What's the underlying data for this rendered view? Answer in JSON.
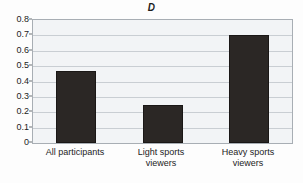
{
  "chart_data": {
    "type": "bar",
    "title": "D",
    "subtitle": "",
    "xlabel": "",
    "ylabel": "",
    "categories": [
      "All participants",
      "Light sports viewers",
      "Heavy sports viewers"
    ],
    "category_lines": [
      [
        "All participants"
      ],
      [
        "Light sports",
        "viewers"
      ],
      [
        "Heavy sports",
        "viewers"
      ]
    ],
    "values": [
      0.47,
      0.25,
      0.7
    ],
    "ylim": [
      0,
      0.8
    ],
    "ytick_labels": [
      "0.8",
      "0.7",
      "0.6",
      "0.5",
      "0.4",
      "0.3",
      "0.2",
      "0.1",
      "0"
    ],
    "ytick_values": [
      0.8,
      0.7,
      0.6,
      0.5,
      0.4,
      0.3,
      0.2,
      0.1,
      0
    ],
    "grid": true,
    "grid_axis": "y",
    "legend": false,
    "legend_position": "none",
    "bar_color": "#2b2725",
    "plot_background": "#f2f4f6",
    "gridline_color": "#c9ced3",
    "axis_color": "#a8aeb4",
    "text_color": "#1c1c1c"
  }
}
